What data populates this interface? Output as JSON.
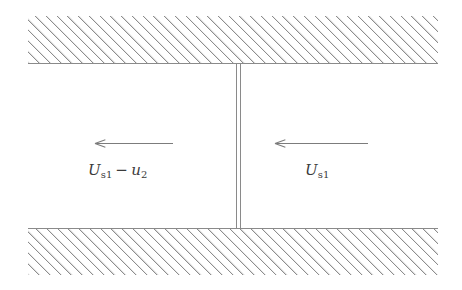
{
  "figure": {
    "type": "schematic-diagram",
    "background_color": "#ffffff",
    "line_color": "#8a8a8a",
    "hatch_color": "#8d8d8d",
    "text_color": "#3b3b3b",
    "width": 462,
    "height": 290
  },
  "walls": {
    "top": {
      "name": "upper-channel-wall",
      "hatch_pattern": "diagonal-45-up-right"
    },
    "bottom": {
      "name": "lower-channel-wall",
      "hatch_pattern": "diagonal-45-up-right"
    }
  },
  "divider": {
    "name": "shock-front",
    "style": "double-vertical-line"
  },
  "flow": {
    "left_region": {
      "arrow_direction": "left",
      "label": {
        "symbol": "U",
        "symbol_sub": "s1",
        "operator": "−",
        "symbol2": "u",
        "symbol2_sub": "2",
        "plain": "U_s1 − u_2"
      }
    },
    "right_region": {
      "arrow_direction": "left",
      "label": {
        "symbol": "U",
        "symbol_sub": "s1",
        "plain": "U_s1"
      }
    }
  }
}
